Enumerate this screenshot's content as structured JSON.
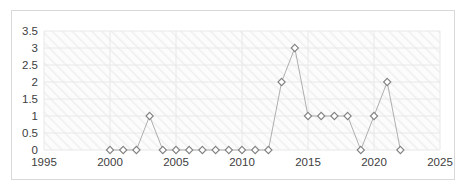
{
  "chart_data": {
    "type": "line",
    "title": "",
    "subtitle": "",
    "xlabel": "",
    "ylabel": "",
    "x": [
      2000,
      2001,
      2002,
      2003,
      2004,
      2005,
      2006,
      2007,
      2008,
      2009,
      2010,
      2011,
      2012,
      2013,
      2014,
      2015,
      2016,
      2017,
      2018,
      2019,
      2020,
      2021,
      2022
    ],
    "values": [
      0,
      0,
      0,
      1,
      0,
      0,
      0,
      0,
      0,
      0,
      0,
      0,
      0,
      2,
      3,
      1,
      1,
      1,
      1,
      0,
      1,
      2,
      0
    ],
    "series": [
      {
        "name": "",
        "values": [
          0,
          0,
          0,
          1,
          0,
          0,
          0,
          0,
          0,
          0,
          0,
          0,
          0,
          2,
          3,
          1,
          1,
          1,
          1,
          0,
          1,
          2,
          0
        ]
      }
    ],
    "xlim": [
      1995,
      2025
    ],
    "ylim": [
      0,
      3.5
    ],
    "xticks": [
      1995,
      2000,
      2005,
      2010,
      2015,
      2020,
      2025
    ],
    "xtick_labels": [
      "1995",
      "2000",
      "2005",
      "2010",
      "2015",
      "2020",
      "2025"
    ],
    "yticks": [
      0,
      0.5,
      1,
      1.5,
      2,
      2.5,
      3,
      3.5
    ],
    "ytick_labels": [
      "0",
      "0.5",
      "1",
      "1.5",
      "2",
      "2.5",
      "3",
      "3.5"
    ],
    "grid": true,
    "grid_x": true,
    "grid_y": true,
    "legend": false,
    "legend_position": "none",
    "annotations": [],
    "marker": "diamond",
    "colors": {
      "line": "#a6a6a6",
      "marker_stroke": "#808080",
      "marker_fill": "#ffffff",
      "grid": "#e8e8e8",
      "border": "#d9d9d9",
      "plot_background": "#fbfbfb",
      "hatch": "#f0f0f0",
      "tick_text": "#404040"
    }
  },
  "axes": {
    "y_axis_name": "value-axis",
    "x_axis_name": "year-axis"
  }
}
